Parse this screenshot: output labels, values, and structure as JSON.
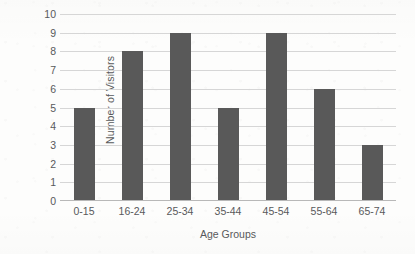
{
  "chart_data": {
    "type": "bar",
    "title": "",
    "subtitle": "",
    "xlabel": "Age Groups",
    "ylabel": "Number of Visitors",
    "categories": [
      "0-15",
      "16-24",
      "25-34",
      "35-44",
      "45-54",
      "55-64",
      "65-74"
    ],
    "values": [
      5,
      8,
      9,
      5,
      9,
      6,
      3
    ],
    "ylim": [
      0,
      10
    ],
    "ytick_labels": [
      "0",
      "1",
      "2",
      "3",
      "4",
      "5",
      "6",
      "7",
      "8",
      "9",
      "10"
    ],
    "ytick_values": [
      0,
      1,
      2,
      3,
      4,
      5,
      6,
      7,
      8,
      9,
      10
    ],
    "grid": "horizontal",
    "legend": "none",
    "bar_color": "#595959",
    "gridline_color": "#d6d6d6",
    "axis_color": "#b8b8b8",
    "text_color": "#58595b",
    "background_color": "#fdfdfc"
  }
}
